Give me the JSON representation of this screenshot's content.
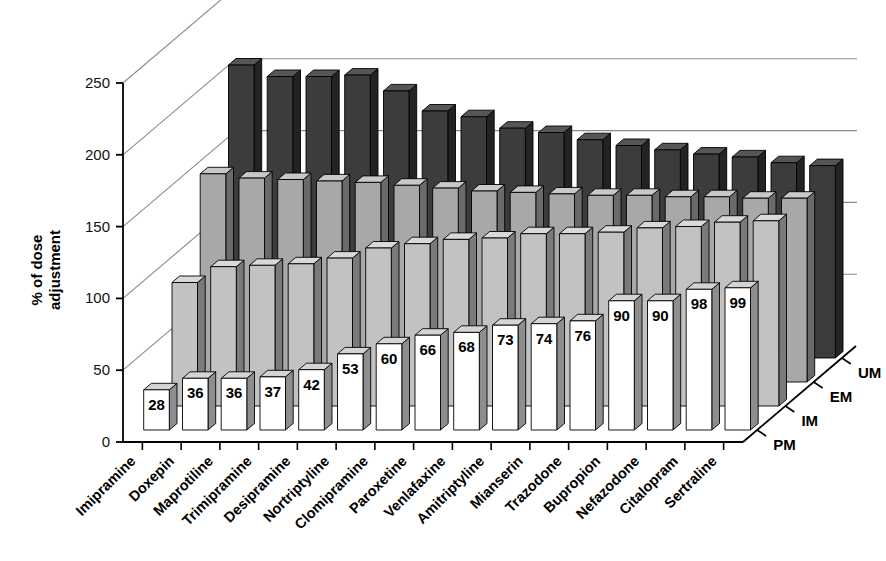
{
  "chart_data": {
    "type": "bar",
    "title": "",
    "subtitle": "",
    "xlabel": "",
    "ylabel": "% of dose adjustment",
    "zlabel": "",
    "ylim": [
      0,
      250
    ],
    "yticks": [
      0,
      50,
      100,
      150,
      200,
      250
    ],
    "grid": true,
    "legend_position": "depth-axis",
    "projection": "3d",
    "categories": [
      "Imipramine",
      "Doxepin",
      "Maprotiline",
      "Trimipramine",
      "Desipramine",
      "Nortriptyline",
      "Clomipramine",
      "Paroxetine",
      "Venlafaxine",
      "Amitriptyline",
      "Mianserin",
      "Trazodone",
      "Bupropion",
      "Nefazodone",
      "Citalopram",
      "Sertraline"
    ],
    "depth_categories": [
      "PM",
      "IM",
      "EM",
      "UM"
    ],
    "series": [
      {
        "name": "PM",
        "color": "#ffffff",
        "side_color": "#8e8e8e",
        "top_color": "#d4d4d4",
        "labels_shown": true,
        "values": [
          28,
          36,
          36,
          37,
          42,
          53,
          60,
          66,
          68,
          73,
          74,
          76,
          90,
          90,
          98,
          99
        ]
      },
      {
        "name": "IM",
        "color": "#c2c2c2",
        "side_color": "#7a7a7a",
        "top_color": "#d9d9d9",
        "labels_shown": false,
        "values": [
          86,
          97,
          98,
          99,
          103,
          110,
          113,
          116,
          117,
          120,
          120,
          121,
          124,
          125,
          128,
          129
        ]
      },
      {
        "name": "EM",
        "color": "#a8a8a8",
        "side_color": "#6a6a6a",
        "top_color": "#c8c8c8",
        "labels_shown": false,
        "values": [
          145,
          142,
          141,
          140,
          139,
          137,
          135,
          133,
          132,
          131,
          130,
          130,
          129,
          129,
          128,
          128
        ]
      },
      {
        "name": "UM",
        "color": "#3c3c3c",
        "side_color": "#232323",
        "top_color": "#565656",
        "labels_shown": false,
        "values": [
          204,
          196,
          196,
          197,
          186,
          172,
          168,
          160,
          157,
          152,
          148,
          145,
          142,
          140,
          136,
          134
        ]
      }
    ],
    "value_labels": [
      28,
      36,
      36,
      37,
      42,
      53,
      60,
      66,
      68,
      73,
      74,
      76,
      90,
      90,
      98,
      99
    ],
    "axis_color": "#000000",
    "gridline_color": "#8a8a8a",
    "background_color": "#ffffff"
  }
}
